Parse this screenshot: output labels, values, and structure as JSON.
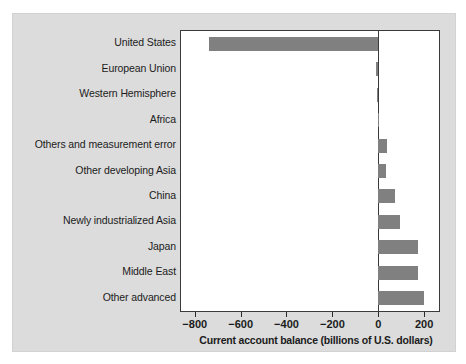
{
  "chart_data": {
    "type": "bar",
    "orientation": "horizontal",
    "title": "",
    "xlabel": "Current account balance (billions of U.S. dollars)",
    "ylabel": "",
    "xlim": [
      -860,
      265
    ],
    "xticks": [
      -800,
      -600,
      -400,
      -200,
      0,
      200
    ],
    "xticklabels": [
      "−800",
      "−600",
      "−400",
      "−200",
      "0",
      "200"
    ],
    "grid": false,
    "legend": null,
    "bar_color": "#808080",
    "plot_background": "#ffffff",
    "figure_background": "#dcdcdc",
    "axis_color": "#3a3a3a",
    "categories": [
      "United States",
      "European Union",
      "Western Hemisphere",
      "Africa",
      "Others and measurement error",
      "Other developing Asia",
      "China",
      "Newly industrialized Asia",
      "Japan",
      "Middle East",
      "Other advanced"
    ],
    "values": [
      -738,
      -8,
      -4,
      4,
      37,
      33,
      75,
      96,
      172,
      174,
      199
    ]
  }
}
